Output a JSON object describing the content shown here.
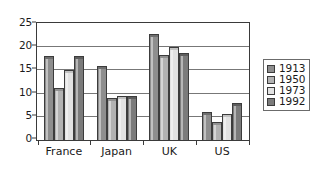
{
  "chart_data": {
    "type": "bar",
    "title": "",
    "subtitle": "",
    "xlabel": "",
    "ylabel": "",
    "categories": [
      "France",
      "Japan",
      "UK",
      "US"
    ],
    "series": [
      {
        "name": "1913",
        "color": "#8e8e8e",
        "values": [
          17.5,
          15.5,
          22.3,
          5.5
        ]
      },
      {
        "name": "1950",
        "color": "#b2b2b2",
        "values": [
          10.7,
          8.5,
          17.8,
          3.3
        ]
      },
      {
        "name": "1973",
        "color": "#e2e2e2",
        "values": [
          14.5,
          9.0,
          19.5,
          5.0
        ]
      },
      {
        "name": "1992",
        "color": "#7b7b7b",
        "values": [
          17.5,
          9.0,
          18.3,
          7.5
        ]
      }
    ],
    "ylim": [
      0,
      25
    ],
    "yticks": [
      0,
      5,
      10,
      15,
      20,
      25
    ],
    "ytick_labels": [
      "0",
      "5",
      "10",
      "15",
      "20",
      "25"
    ],
    "grid": true,
    "grid_axis": "y",
    "legend_position": "right",
    "legend_entries": [
      "1913",
      "1950",
      "1973",
      "1992"
    ]
  }
}
